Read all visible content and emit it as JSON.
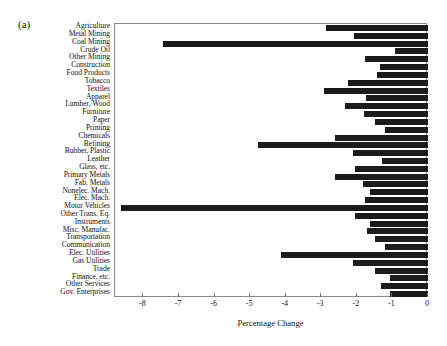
{
  "figure": {
    "panel_label": "(a)",
    "bar_color": "#1b1b1b",
    "frame_color": "#8a8a8a"
  },
  "chart_data": {
    "type": "bar",
    "orientation": "horizontal",
    "title": "",
    "subtitle": "",
    "xlabel": "Percentage Change",
    "ylabel": "",
    "xlim": [
      -8.8,
      0
    ],
    "ylim": [
      0,
      31
    ],
    "grid": false,
    "legend": null,
    "xticks": [
      -8,
      -7,
      -6,
      -5,
      -4,
      -3,
      -2,
      -1,
      0
    ],
    "xticklabels": [
      "-8",
      "-7",
      "-6",
      "-5",
      "-4",
      "-3",
      "-2",
      "-1",
      "0"
    ],
    "categories": [
      "Agriculture",
      "Metal Mining",
      "Coal Mining",
      "Crude Oil",
      "Other Mining",
      "Construction",
      "Food Products",
      "Tobacco",
      "Textiles",
      "Apparel",
      "Lumber, Wood",
      "Furniture",
      "Paper",
      "Printing",
      "Chemicals",
      "Refining",
      "Rubber, Plastic",
      "Leather",
      "Glass, etc.",
      "Primary Metals",
      "Fab. Metals",
      "Nonelec. Mach.",
      "Elec. Mach.",
      "Motor Vehicles",
      "Other Trans. Eq.",
      "Instruments",
      "Misc. Manufac.",
      "Transportation",
      "Communication",
      "Elec. Utilities",
      "Gas Utilities",
      "Trade",
      "Finance, etc.",
      "Other Services",
      "Gov. Enterprises"
    ],
    "values": [
      -2.88,
      -2.08,
      -7.45,
      -0.92,
      -1.78,
      -1.36,
      -1.44,
      -2.26,
      -2.92,
      -1.74,
      -2.34,
      -1.8,
      -1.48,
      -1.22,
      -2.62,
      -4.78,
      -2.12,
      -1.28,
      -2.04,
      -2.62,
      -1.84,
      -1.62,
      -1.78,
      -8.62,
      -2.06,
      -1.62,
      -1.72,
      -1.48,
      -1.2,
      -4.12,
      -2.1,
      -1.48,
      -1.06,
      -1.32,
      -1.06
    ]
  }
}
